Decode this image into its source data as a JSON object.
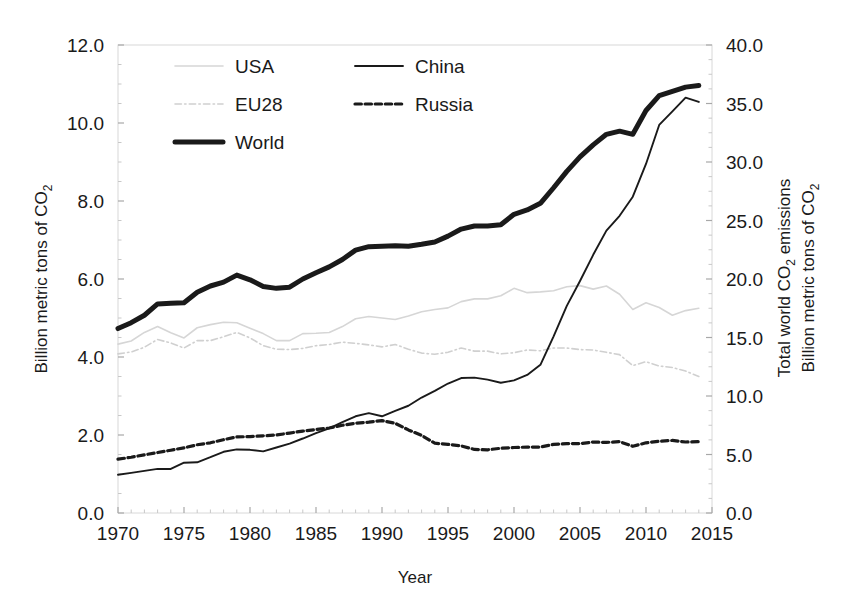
{
  "chart_data": {
    "type": "line",
    "title": "",
    "xlabel": "Year",
    "ylabel_left": "Billion metric tons of CO₂",
    "ylabel_right_line1": "Total world CO₂ emissions",
    "ylabel_right_line2": "Billion metric tons of CO₂",
    "xlim": [
      1970,
      2015
    ],
    "ylim_left": [
      0.0,
      12.0
    ],
    "ylim_right": [
      0.0,
      40.0
    ],
    "xticks": [
      1970,
      1975,
      1980,
      1985,
      1990,
      1995,
      2000,
      2005,
      2010,
      2015
    ],
    "xtick_labels": [
      "1970",
      "1975",
      "1980",
      "1985",
      "1990",
      "1995",
      "2000",
      "2005",
      "2010",
      "2015"
    ],
    "yticks_left": [
      0.0,
      2.0,
      4.0,
      6.0,
      8.0,
      10.0,
      12.0
    ],
    "ytick_labels_left": [
      "0.0",
      "2.0",
      "4.0",
      "6.0",
      "8.0",
      "10.0",
      "12.0"
    ],
    "yticks_right": [
      0.0,
      5.0,
      10.0,
      15.0,
      20.0,
      25.0,
      30.0,
      35.0,
      40.0
    ],
    "ytick_labels_right": [
      "0.0",
      "5.0",
      "10.0",
      "15.0",
      "20.0",
      "25.0",
      "30.0",
      "35.0",
      "40.0"
    ],
    "grid": false,
    "legend_position": "top-center",
    "x": [
      1970,
      1971,
      1972,
      1973,
      1974,
      1975,
      1976,
      1977,
      1978,
      1979,
      1980,
      1981,
      1982,
      1983,
      1984,
      1985,
      1986,
      1987,
      1988,
      1989,
      1990,
      1991,
      1992,
      1993,
      1994,
      1995,
      1996,
      1997,
      1998,
      1999,
      2000,
      2001,
      2002,
      2003,
      2004,
      2005,
      2006,
      2007,
      2008,
      2009,
      2010,
      2011,
      2012,
      2013,
      2014
    ],
    "series": [
      {
        "name": "USA",
        "axis": "left",
        "color": "#d6d6d6",
        "style": "solid",
        "width": 1.6,
        "values": [
          4.33,
          4.41,
          4.63,
          4.78,
          4.62,
          4.49,
          4.75,
          4.83,
          4.89,
          4.88,
          4.74,
          4.6,
          4.42,
          4.42,
          4.6,
          4.61,
          4.63,
          4.78,
          4.98,
          5.04,
          5.0,
          4.96,
          5.05,
          5.16,
          5.22,
          5.26,
          5.42,
          5.49,
          5.49,
          5.57,
          5.76,
          5.65,
          5.67,
          5.7,
          5.8,
          5.83,
          5.74,
          5.82,
          5.61,
          5.22,
          5.39,
          5.27,
          5.07,
          5.19,
          5.25
        ]
      },
      {
        "name": "EU28",
        "axis": "left",
        "color": "#d0d0d0",
        "style": "dashdot",
        "width": 1.6,
        "values": [
          4.08,
          4.13,
          4.25,
          4.45,
          4.36,
          4.23,
          4.42,
          4.42,
          4.52,
          4.63,
          4.49,
          4.29,
          4.2,
          4.19,
          4.22,
          4.29,
          4.32,
          4.38,
          4.35,
          4.31,
          4.26,
          4.32,
          4.2,
          4.1,
          4.07,
          4.12,
          4.23,
          4.15,
          4.15,
          4.08,
          4.11,
          4.18,
          4.16,
          4.23,
          4.23,
          4.19,
          4.18,
          4.12,
          4.06,
          3.78,
          3.88,
          3.77,
          3.73,
          3.64,
          3.5
        ]
      },
      {
        "name": "World",
        "axis": "left",
        "color": "#1a1a1a",
        "style": "solid",
        "width": 5.0,
        "values": [
          4.73,
          4.88,
          5.07,
          5.36,
          5.38,
          5.39,
          5.66,
          5.82,
          5.92,
          6.1,
          5.98,
          5.81,
          5.76,
          5.79,
          6.0,
          6.16,
          6.31,
          6.5,
          6.74,
          6.83,
          6.84,
          6.85,
          6.84,
          6.89,
          6.95,
          7.1,
          7.28,
          7.36,
          7.36,
          7.39,
          7.66,
          7.77,
          7.94,
          8.34,
          8.76,
          9.13,
          9.44,
          9.71,
          9.79,
          9.71,
          10.32,
          10.7,
          10.81,
          10.92,
          10.96
        ]
      },
      {
        "name": "China",
        "axis": "left",
        "color": "#1a1a1a",
        "style": "solid",
        "width": 1.9,
        "values": [
          0.98,
          1.03,
          1.08,
          1.13,
          1.13,
          1.29,
          1.3,
          1.43,
          1.57,
          1.63,
          1.62,
          1.58,
          1.68,
          1.78,
          1.91,
          2.05,
          2.17,
          2.33,
          2.48,
          2.56,
          2.48,
          2.62,
          2.75,
          2.96,
          3.13,
          3.32,
          3.46,
          3.47,
          3.42,
          3.34,
          3.4,
          3.54,
          3.8,
          4.53,
          5.31,
          5.95,
          6.62,
          7.24,
          7.62,
          8.11,
          8.95,
          9.95,
          10.3,
          10.65,
          10.54
        ]
      },
      {
        "name": "Russia",
        "axis": "left",
        "color": "#1a1a1a",
        "style": "dashed",
        "width": 3.2,
        "values": [
          1.38,
          1.43,
          1.49,
          1.55,
          1.61,
          1.67,
          1.75,
          1.8,
          1.88,
          1.95,
          1.96,
          1.98,
          2.0,
          2.05,
          2.1,
          2.14,
          2.18,
          2.25,
          2.3,
          2.33,
          2.37,
          2.3,
          2.13,
          1.99,
          1.79,
          1.76,
          1.72,
          1.63,
          1.62,
          1.66,
          1.68,
          1.69,
          1.69,
          1.76,
          1.78,
          1.78,
          1.82,
          1.81,
          1.83,
          1.71,
          1.8,
          1.84,
          1.86,
          1.82,
          1.83
        ]
      }
    ],
    "legend": [
      {
        "label": "USA",
        "style": "solid",
        "color": "#d6d6d6",
        "width": 1.6,
        "col": 0,
        "row": 0
      },
      {
        "label": "EU28",
        "style": "dashdot",
        "color": "#d0d0d0",
        "width": 1.6,
        "col": 0,
        "row": 1
      },
      {
        "label": "World",
        "style": "solid",
        "color": "#1a1a1a",
        "width": 5.0,
        "col": 0,
        "row": 2
      },
      {
        "label": "China",
        "style": "solid",
        "color": "#1a1a1a",
        "width": 1.9,
        "col": 1,
        "row": 0
      },
      {
        "label": "Russia",
        "style": "dashed",
        "color": "#1a1a1a",
        "width": 3.2,
        "col": 1,
        "row": 1
      }
    ]
  },
  "axes": {
    "left_title": "Billion metric tons of CO",
    "left_sub": "2",
    "right_title_a": "Total world CO",
    "right_title_a_sub": "2",
    "right_title_a_tail": " emissions",
    "right_title_b": "Billion metric tons of CO",
    "right_title_b_sub": "2",
    "x_title": "Year"
  }
}
